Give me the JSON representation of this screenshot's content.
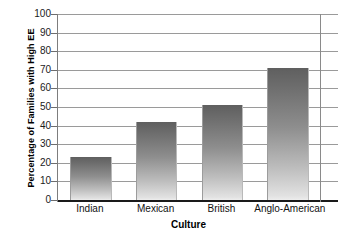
{
  "chart_data": {
    "type": "bar",
    "title": "",
    "xlabel": "Culture",
    "ylabel": "Percentage of Families with High EE",
    "categories": [
      "Indian",
      "Mexican",
      "British",
      "Anglo-American"
    ],
    "values": [
      23,
      42,
      51,
      71
    ],
    "ylim": [
      0,
      100
    ],
    "ytick_step": 10,
    "yticks": [
      "100",
      "90",
      "80",
      "70",
      "60",
      "50",
      "40",
      "30",
      "20",
      "10",
      "0"
    ],
    "grid": "horizontal",
    "legend": "none",
    "bar_fill": "vertical-gradient-dark-to-light",
    "bar_color_top": "#5f5f5f",
    "bar_color_bottom": "#ededed",
    "gridline_color": "#9a9a9a",
    "axis_color": "#1a1a1a",
    "series": [
      {
        "name": "Percentage of Families with High EE",
        "values": [
          23,
          42,
          51,
          71
        ]
      }
    ]
  }
}
